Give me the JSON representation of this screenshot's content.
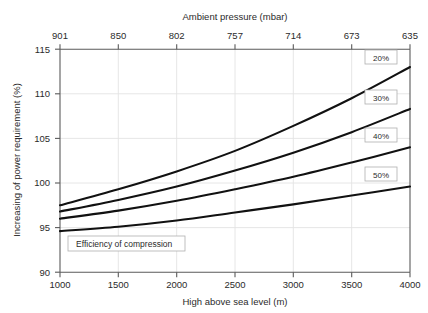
{
  "chart_data": {
    "type": "line",
    "title": "",
    "xlabel": "High above sea level (m)",
    "ylabel": "Increasing of power requirement (%)",
    "secondary_xlabel": "Ambient pressure (mbar)",
    "legend_title": "Efficiency of compression",
    "legend_position": "inline-right-of-curves",
    "grid": true,
    "xlim": [
      1000,
      4000
    ],
    "ylim": [
      90,
      115
    ],
    "x_ticks": [
      1000,
      1500,
      2000,
      2500,
      3000,
      3500,
      4000
    ],
    "x_tick_labels": [
      "1000",
      "1500",
      "2000",
      "2500",
      "3000",
      "3500",
      "4000"
    ],
    "y_ticks": [
      90,
      95,
      100,
      105,
      110,
      115
    ],
    "y_tick_labels": [
      "90",
      "95",
      "100",
      "105",
      "110",
      "115"
    ],
    "secondary_x_ticks": [
      1000,
      1500,
      2000,
      2500,
      3000,
      3500,
      4000
    ],
    "secondary_x_tick_labels": [
      "901",
      "850",
      "802",
      "757",
      "714",
      "673",
      "635"
    ],
    "x": [
      1000,
      1500,
      2000,
      2500,
      3000,
      3500,
      4000
    ],
    "series": [
      {
        "name": "20%",
        "label": "20%",
        "values": [
          97.5,
          99.3,
          101.3,
          103.6,
          106.4,
          109.5,
          113.0
        ]
      },
      {
        "name": "30%",
        "label": "30%",
        "values": [
          96.8,
          98.1,
          99.6,
          101.4,
          103.4,
          105.7,
          108.3
        ]
      },
      {
        "name": "40%",
        "label": "40%",
        "values": [
          96.0,
          96.9,
          98.0,
          99.3,
          100.7,
          102.3,
          104.0
        ]
      },
      {
        "name": "50%",
        "label": "50%",
        "values": [
          94.6,
          95.1,
          95.8,
          96.7,
          97.6,
          98.6,
          99.6
        ]
      }
    ]
  },
  "axes": {
    "bottom_title": "High above sea level (m)",
    "left_title": "Increasing of power requirement (%)",
    "top_title": "Ambient pressure (mbar)"
  },
  "legend": {
    "title": "Efficiency of compression"
  }
}
